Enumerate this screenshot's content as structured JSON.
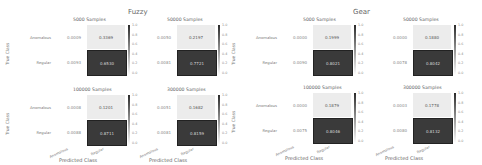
{
  "chart_data": {
    "type": "heatmap",
    "title": "",
    "xlabel": "Predicted Class",
    "ylabel": "True Class",
    "row_labels": [
      "Anomalous",
      "Regular"
    ],
    "col_labels": [
      "Anomalous",
      "Regular"
    ],
    "colorbar_ticks": [
      "1.0",
      "0.8",
      "0.6",
      "0.4",
      "0.2",
      "0.0"
    ],
    "colorbar_range": [
      0.0,
      1.0
    ],
    "groups": [
      {
        "title": "Fuzzy",
        "panels": [
          {
            "title": "5000 Samples",
            "matrix": [
              [
                "0.0009",
                "0.3369"
              ],
              [
                "0.0093",
                "0.6530"
              ]
            ]
          },
          {
            "title": "50000 Samples",
            "matrix": [
              [
                "0.0050",
                "0.2197"
              ],
              [
                "0.0081",
                "0.7721"
              ]
            ]
          },
          {
            "title": "100000 Samples",
            "matrix": [
              [
                "0.0008",
                "0.1201"
              ],
              [
                "0.0088",
                "0.8711"
              ]
            ]
          },
          {
            "title": "300000 Samples",
            "matrix": [
              [
                "0.0051",
                "0.1682"
              ],
              [
                "0.0081",
                "0.8159"
              ]
            ]
          }
        ]
      },
      {
        "title": "Gear",
        "panels": [
          {
            "title": "5000 Samples",
            "matrix": [
              [
                "0.0000",
                "0.1999"
              ],
              [
                "0.0090",
                "0.8021"
              ]
            ]
          },
          {
            "title": "50000 Samples",
            "matrix": [
              [
                "0.0000",
                "0.1880"
              ],
              [
                "0.0078",
                "0.8042"
              ]
            ]
          },
          {
            "title": "100000 Samples",
            "matrix": [
              [
                "0.0000",
                "0.1879"
              ],
              [
                "0.0075",
                "0.8046"
              ]
            ]
          },
          {
            "title": "300000 Samples",
            "matrix": [
              [
                "0.0003",
                "0.1778"
              ],
              [
                "0.0080",
                "0.8132"
              ]
            ]
          }
        ]
      }
    ]
  }
}
